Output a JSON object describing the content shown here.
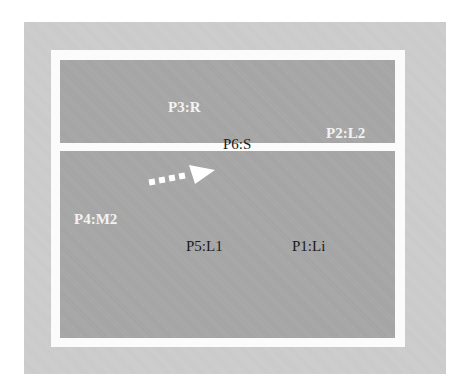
{
  "diagram": {
    "labels": {
      "p3": "P3:R",
      "p2": "P2:L2",
      "p6": "P6:S",
      "p4": "P4:M2",
      "p5": "P5:L1",
      "p1": "P1:Li"
    },
    "arrow": {
      "style": "dotted",
      "direction": "up-right",
      "color": "#ffffff"
    },
    "colors": {
      "outer_panel": "#c9c9c9",
      "frame": "#fbfbfb",
      "region": "#a3a3a3",
      "light_text": "#f2f2f2",
      "dark_text": "#1a1a1a"
    }
  }
}
